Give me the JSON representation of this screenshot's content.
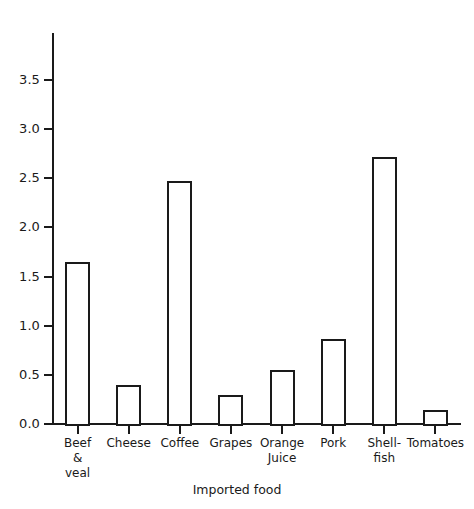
{
  "chart_data": {
    "type": "bar",
    "title": "",
    "subtitle": "",
    "xlabel": "Imported food",
    "ylabel": "",
    "categories": [
      "Beef\n&\nveal",
      "Cheese",
      "Coffee",
      "Grapes",
      "Orange\nJuice",
      "Pork",
      "Shell-\nfish",
      "Tomatoes"
    ],
    "values": [
      1.65,
      0.4,
      2.47,
      0.29,
      0.55,
      0.86,
      2.72,
      0.14
    ],
    "ylim": [
      0.0,
      3.75
    ],
    "xlim": [
      0,
      8
    ],
    "yticks": [
      0.0,
      0.5,
      1.0,
      1.5,
      2.0,
      2.5,
      3.0,
      3.5
    ],
    "ytick_labels": [
      "0.0",
      "0.5",
      "1.0",
      "1.5",
      "2.0",
      "2.5",
      "3.0",
      "3.5"
    ],
    "grid": false,
    "legend": false,
    "bar_fill_color": "#ffffff",
    "bar_edge_color": "#1a1a1a",
    "axis_color": "#1a1a1a",
    "background_color": "#ffffff"
  },
  "labels": {
    "y_0": "0.0",
    "y_1": "0.5",
    "y_2": "1.0",
    "y_3": "1.5",
    "y_4": "2.0",
    "y_5": "2.5",
    "y_6": "3.0",
    "y_7": "3.5",
    "cat_0": "Beef\n&\nveal",
    "cat_1": "Cheese",
    "cat_2": "Coffee",
    "cat_3": "Grapes",
    "cat_4": "Orange\nJuice",
    "cat_5": "Pork",
    "cat_6": "Shell-\nfish",
    "cat_7": "Tomatoes",
    "xaxis_title": "Imported food"
  }
}
